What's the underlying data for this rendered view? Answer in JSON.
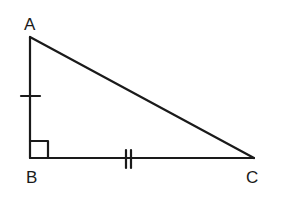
{
  "diagram": {
    "type": "right-triangle",
    "vertices": [
      {
        "name": "A",
        "label": "A"
      },
      {
        "name": "B",
        "label": "B"
      },
      {
        "name": "C",
        "label": "C"
      }
    ],
    "right_angle_at": "B",
    "congruence_marks": {
      "AB": "single tick",
      "BC": "double tick"
    },
    "stroke_color": "#1a1a1a",
    "background": "#ffffff"
  }
}
